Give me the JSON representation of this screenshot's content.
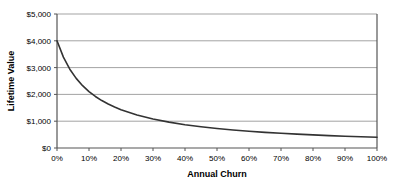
{
  "chart_data": {
    "type": "line",
    "title": "",
    "xlabel": "Annual Churn",
    "ylabel": "Lifetime Value",
    "xlim": [
      0,
      100
    ],
    "ylim": [
      0,
      5000
    ],
    "grid": true,
    "legend": null,
    "x_tick_labels": [
      "0%",
      "10%",
      "20%",
      "30%",
      "40%",
      "50%",
      "60%",
      "70%",
      "80%",
      "90%",
      "100%"
    ],
    "x_tick_values": [
      0,
      10,
      20,
      30,
      40,
      50,
      60,
      70,
      80,
      90,
      100
    ],
    "y_tick_labels": [
      "$0",
      "$1,000",
      "$2,000",
      "$3,000",
      "$4,000",
      "$5,000"
    ],
    "y_tick_values": [
      0,
      1000,
      2000,
      3000,
      4000,
      5000
    ],
    "series": [
      {
        "name": "Lifetime Value",
        "color": "#333333",
        "x": [
          0,
          2,
          4,
          6,
          8,
          10,
          12,
          14,
          16,
          18,
          20,
          25,
          30,
          35,
          40,
          45,
          50,
          55,
          60,
          65,
          70,
          75,
          80,
          85,
          90,
          95,
          100
        ],
        "values": [
          4000,
          3390,
          2941,
          2597,
          2326,
          2105,
          1923,
          1770,
          1639,
          1527,
          1429,
          1231,
          1081,
          964,
          870,
          792,
          727,
          672,
          625,
          584,
          548,
          516,
          488,
          462,
          440,
          419,
          400
        ]
      }
    ]
  },
  "axes": {
    "y_title": "Lifetime Value",
    "x_title": "Annual Churn"
  },
  "colors": {
    "line": "#333333",
    "grid": "#999999",
    "axis": "#555555",
    "text": "#000000",
    "background": "#ffffff"
  }
}
